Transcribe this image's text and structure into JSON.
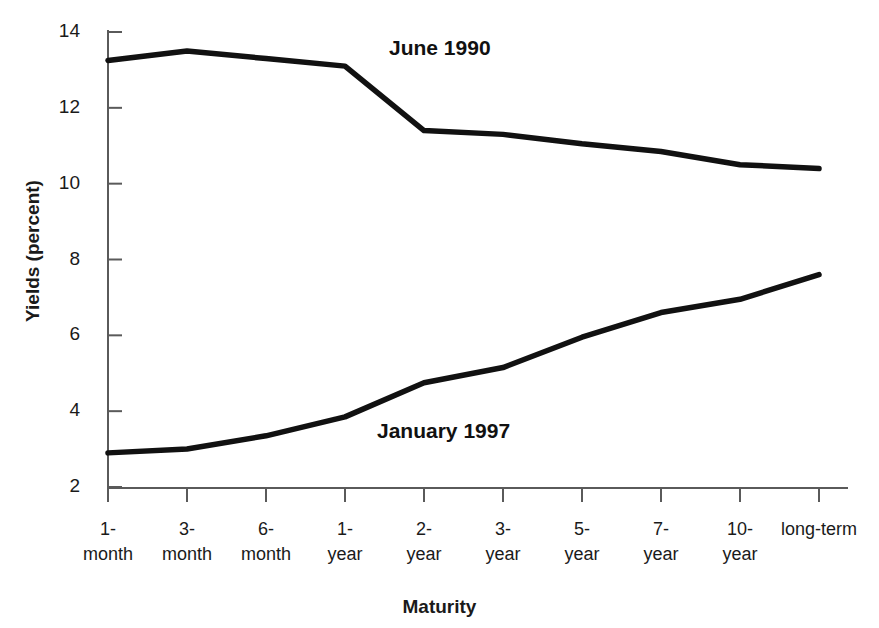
{
  "chart_data": {
    "type": "line",
    "title": "",
    "xlabel": "Maturity",
    "ylabel": "Yields (percent)",
    "categories": [
      "1-month",
      "3-month",
      "6-month",
      "1-year",
      "2-year",
      "3-year",
      "5-year",
      "7-year",
      "10-year",
      "long-term"
    ],
    "category_lines": [
      [
        "1-",
        "month"
      ],
      [
        "3-",
        "month"
      ],
      [
        "6-",
        "month"
      ],
      [
        "1-",
        "year"
      ],
      [
        "2-",
        "year"
      ],
      [
        "3-",
        "year"
      ],
      [
        "5-",
        "year"
      ],
      [
        "7-",
        "year"
      ],
      [
        "10-",
        "year"
      ],
      [
        "long-term",
        ""
      ]
    ],
    "series": [
      {
        "name": "June 1990",
        "color": "#111111",
        "values": [
          13.25,
          13.5,
          13.3,
          13.1,
          11.4,
          11.3,
          11.05,
          10.85,
          10.5,
          10.4
        ]
      },
      {
        "name": "January 1997",
        "color": "#111111",
        "values": [
          2.9,
          3.0,
          3.35,
          3.85,
          4.75,
          5.15,
          5.95,
          6.6,
          6.95,
          7.6
        ]
      }
    ],
    "ylim": [
      2,
      14
    ],
    "yticks": [
      2,
      4,
      6,
      8,
      10,
      12,
      14
    ],
    "ytick_labels": [
      "2",
      "4",
      "6",
      "8",
      "10",
      "12",
      "14"
    ],
    "grid": false,
    "legend": "inline-annotations",
    "annotations": [
      {
        "text": "June 1990",
        "x_px": 389,
        "y_px": 36
      },
      {
        "text": "January 1997",
        "x_px": 377,
        "y_px": 419
      }
    ]
  },
  "axes": {
    "y_title": "Yields (percent)",
    "x_title": "Maturity"
  }
}
